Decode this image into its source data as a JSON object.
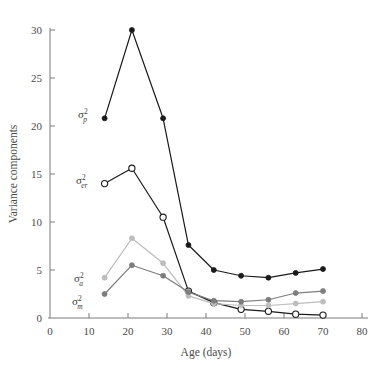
{
  "chart_data": {
    "type": "line",
    "title": "",
    "xlabel": "Age (days)",
    "ylabel": "Variance components",
    "xlim": [
      0,
      80
    ],
    "ylim": [
      0,
      31
    ],
    "xticks": [
      0,
      10,
      20,
      30,
      40,
      50,
      60,
      70,
      80
    ],
    "yticks": [
      0,
      5,
      10,
      15,
      20,
      25,
      30
    ],
    "grid": false,
    "legend": "inline-labels",
    "x": [
      14,
      21,
      29,
      35.5,
      42,
      49,
      56,
      63,
      70
    ],
    "series": [
      {
        "name": "sigma-squared-p",
        "label_base": "σ",
        "label_sup": "2",
        "label_sub": "p",
        "color": "#1a1a1a",
        "marker": "filled-circle",
        "values": [
          20.8,
          30.0,
          20.8,
          7.6,
          5.0,
          4.4,
          4.2,
          4.7,
          5.1
        ]
      },
      {
        "name": "sigma-squared-er",
        "label_base": "σ",
        "label_sup": "2",
        "label_sub": "er",
        "color": "#1a1a1a",
        "marker": "open-circle",
        "values": [
          14.0,
          15.6,
          10.5,
          2.8,
          1.6,
          0.9,
          0.7,
          0.4,
          0.3
        ]
      },
      {
        "name": "sigma-squared-a",
        "label_base": "σ",
        "label_sup": "2",
        "label_sub": "a",
        "color": "#bdbdbd",
        "marker": "filled-circle",
        "values": [
          4.2,
          8.3,
          5.7,
          2.3,
          1.5,
          1.3,
          1.3,
          1.5,
          1.7
        ]
      },
      {
        "name": "sigma-squared-m",
        "label_base": "σ",
        "label_sup": "2",
        "label_sub": "m",
        "color": "#7d7d7d",
        "marker": "filled-circle",
        "values": [
          2.5,
          5.5,
          4.4,
          2.7,
          1.8,
          1.7,
          1.9,
          2.6,
          2.8
        ]
      }
    ]
  },
  "axes": {
    "x_tick_labels": [
      "0",
      "10",
      "20",
      "30",
      "40",
      "50",
      "60",
      "70",
      "80"
    ],
    "y_tick_labels": [
      "0",
      "5",
      "10",
      "15",
      "20",
      "25",
      "30"
    ],
    "x_title": "Age (days)",
    "y_title": "Variance components"
  },
  "colors": {
    "axis": "#7a7a7a",
    "text": "#4a4a4a",
    "series_dark": "#1a1a1a",
    "series_mid": "#7d7d7d",
    "series_light": "#bdbdbd",
    "background": "#ffffff"
  }
}
